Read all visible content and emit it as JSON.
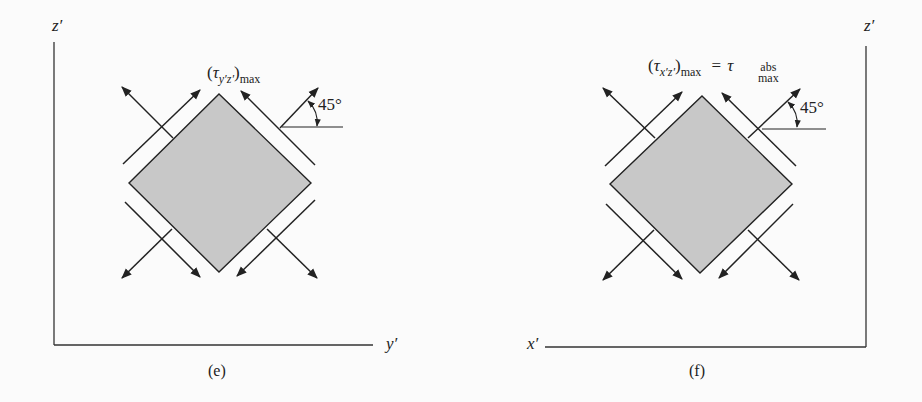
{
  "panels": [
    {
      "id": "e",
      "caption": "(e)",
      "axes": {
        "vertical": "z′",
        "horizontal": "y′"
      },
      "stress_label": {
        "open": "(",
        "symbol": "τ",
        "subscript": "y′z′",
        "close": ")",
        "max": "max",
        "equals": "",
        "rhs_symbol": "",
        "rhs_sub_top": "",
        "rhs_sub_bottom": ""
      },
      "angle_label": "45°",
      "element_fill": "#c8c8c8"
    },
    {
      "id": "f",
      "caption": "(f)",
      "axes": {
        "vertical": "z′",
        "horizontal": "x′"
      },
      "stress_label": {
        "open": "(",
        "symbol": "τ",
        "subscript": "x′z′",
        "close": ")",
        "max": "max",
        "equals": "=",
        "rhs_symbol": "τ",
        "rhs_sub_top": "abs",
        "rhs_sub_bottom": "max"
      },
      "angle_label": "45°",
      "element_fill": "#c8c8c8"
    }
  ],
  "colors": {
    "line": "#222222",
    "fill": "#c8c8c8",
    "background": "#fbfbfb"
  }
}
